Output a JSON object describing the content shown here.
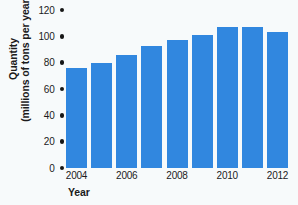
{
  "chart_data": {
    "type": "bar",
    "title": "",
    "xlabel": "Year",
    "ylabel": "Quantity (millions of tons per year)",
    "ylabel_line1": "Quantity",
    "ylabel_line2": "(millions of tons per year)",
    "categories": [
      "2004",
      "2005",
      "2006",
      "2007",
      "2008",
      "2009",
      "2010",
      "2011",
      "2012"
    ],
    "values": [
      76,
      80,
      86,
      93,
      97,
      101,
      107,
      107,
      103
    ],
    "visible_x_tick_labels": [
      "2004",
      "2006",
      "2008",
      "2010",
      "2012"
    ],
    "y_tick_labels": [
      "120",
      "100",
      "80",
      "60",
      "40",
      "20",
      "0"
    ],
    "y_tick_values": [
      120,
      100,
      80,
      60,
      40,
      20,
      0
    ],
    "ylim": [
      0,
      120
    ],
    "grid": false,
    "legend": "none",
    "bar_color": "#3187df",
    "background_color": "#f7fafb",
    "text_color": "#1b1b1b",
    "tick_marker_color": "#161616",
    "tick_marker_shape": "dot"
  }
}
